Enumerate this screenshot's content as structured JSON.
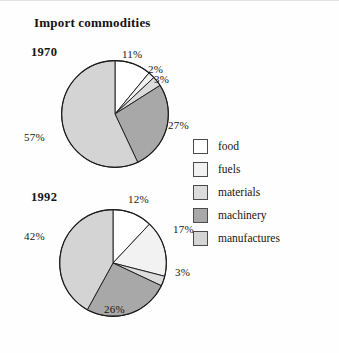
{
  "title": "Import commodities",
  "colors": {
    "food": "#ffffff",
    "fuels": "#f2f2f2",
    "materials": "#dcdcdc",
    "machinery": "#a8a8a8",
    "manufactures": "#d4d4d4",
    "outline": "#1a1a1a",
    "text": "#18150f",
    "background": "#fefefe"
  },
  "legend": {
    "position": "right",
    "items": [
      {
        "label": "food",
        "color": "#ffffff"
      },
      {
        "label": "fuels",
        "color": "#f2f2f2"
      },
      {
        "label": "materials",
        "color": "#dcdcdc"
      },
      {
        "label": "machinery",
        "color": "#a8a8a8"
      },
      {
        "label": "manufactures",
        "color": "#d4d4d4"
      }
    ]
  },
  "charts": [
    {
      "year": "1970",
      "labels": {
        "food": "11%",
        "fuels": "2%",
        "materials": "3%",
        "machinery": "27%",
        "manufactures": "57%"
      }
    },
    {
      "year": "1992",
      "labels": {
        "food": "12%",
        "fuels": "17%",
        "materials": "3%",
        "machinery": "26%",
        "manufactures": "42%"
      }
    }
  ],
  "chart_data": [
    {
      "type": "pie",
      "title": "1970",
      "categories": [
        "food",
        "fuels",
        "materials",
        "machinery",
        "manufactures"
      ],
      "values": [
        11,
        2,
        3,
        27,
        57
      ],
      "value_labels": [
        "11%",
        "2%",
        "3%",
        "27%",
        "57%"
      ],
      "units": "percent",
      "start_angle_deg": 0,
      "direction": "clockwise",
      "slice_colors": [
        "#ffffff",
        "#f2f2f2",
        "#dcdcdc",
        "#a8a8a8",
        "#d4d4d4"
      ],
      "legend": [
        "food",
        "fuels",
        "materials",
        "machinery",
        "manufactures"
      ]
    },
    {
      "type": "pie",
      "title": "1992",
      "categories": [
        "food",
        "fuels",
        "materials",
        "machinery",
        "manufactures"
      ],
      "values": [
        12,
        17,
        3,
        26,
        42
      ],
      "value_labels": [
        "12%",
        "17%",
        "3%",
        "26%",
        "42%"
      ],
      "units": "percent",
      "start_angle_deg": 0,
      "direction": "clockwise",
      "slice_colors": [
        "#ffffff",
        "#f2f2f2",
        "#dcdcdc",
        "#a8a8a8",
        "#d4d4d4"
      ],
      "legend": [
        "food",
        "fuels",
        "materials",
        "machinery",
        "manufactures"
      ]
    }
  ]
}
